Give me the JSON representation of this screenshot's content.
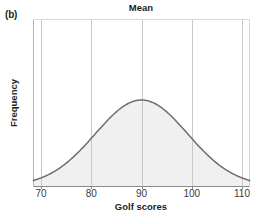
{
  "figure": {
    "panel_label": "(b)",
    "background_color": "#ffffff"
  },
  "chart_data": {
    "type": "line",
    "title": "Mean",
    "xlabel": "Golf scores",
    "ylabel": "Frequency",
    "xlim": [
      68,
      112
    ],
    "ylim": [
      0,
      1.12
    ],
    "grid": true,
    "legend": null,
    "annotations": [
      {
        "text": "Mean",
        "x": 90,
        "note": "title placed above the mean / center of the symmetric distribution"
      }
    ],
    "xticks": [
      70,
      80,
      90,
      100,
      110
    ],
    "xtick_labels": [
      "70",
      "80",
      "90",
      "100",
      "110"
    ],
    "yticks": [],
    "ytick_labels": [],
    "distribution": {
      "shape": "normal",
      "mean": 90,
      "std_dev": 9.2,
      "symmetric": true,
      "peak_x": 90
    },
    "x": [
      68,
      70,
      72,
      74,
      76,
      78,
      80,
      82,
      84,
      86,
      88,
      90,
      92,
      94,
      96,
      98,
      100,
      102,
      104,
      106,
      108,
      110,
      112
    ],
    "values": [
      0.012,
      0.026,
      0.054,
      0.1,
      0.172,
      0.27,
      0.394,
      0.532,
      0.67,
      0.8,
      0.915,
      1.0,
      0.915,
      0.8,
      0.67,
      0.532,
      0.394,
      0.27,
      0.172,
      0.1,
      0.054,
      0.026,
      0.012
    ],
    "series": [
      {
        "name": "Frequency",
        "values": [
          0.012,
          0.026,
          0.054,
          0.1,
          0.172,
          0.27,
          0.394,
          0.532,
          0.67,
          0.8,
          0.915,
          1.0,
          0.915,
          0.8,
          0.67,
          0.532,
          0.394,
          0.27,
          0.172,
          0.1,
          0.054,
          0.026,
          0.012
        ]
      }
    ],
    "colors": {
      "curve_stroke": "#6e6e6e",
      "curve_fill": "#f0f0f0",
      "gridline": "#c9c9c9",
      "axis": "#b5b5b5",
      "text": "#231f20"
    }
  }
}
